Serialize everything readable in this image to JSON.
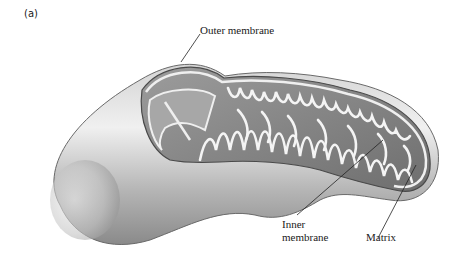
{
  "figure": {
    "panel_label": "(a)",
    "labels": {
      "outer_membrane": "Outer membrane",
      "inner_membrane_line1": "Inner",
      "inner_membrane_line2": "membrane",
      "matrix": "Matrix"
    },
    "colors": {
      "background": "#ffffff",
      "body_light": "#e6e6e6",
      "body_mid": "#b8b8b8",
      "body_dark": "#7a7a7a",
      "interior": "#8f8f8f",
      "cristae_fill": "#f2f2f2",
      "leader_line": "#222222"
    }
  }
}
